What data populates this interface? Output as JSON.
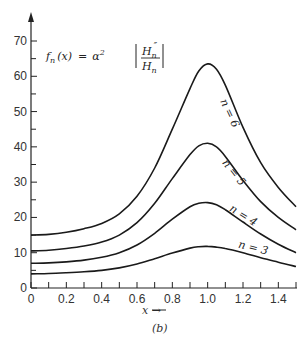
{
  "chart_data": {
    "type": "line",
    "formula": {
      "lhs": "f",
      "lhs_sub": "n",
      "lhs_arg": "(x)",
      "eq": "=",
      "alpha": "α",
      "sup": "2",
      "num": "H",
      "num_sub": "n",
      "num_sup": "″",
      "den": "H",
      "den_sub": "n"
    },
    "xlabel": "x →",
    "ylabel": "",
    "caption": "(b)",
    "xlim": [
      0,
      1.5
    ],
    "ylim": [
      0,
      75
    ],
    "grid": false,
    "legend_position": "inline labels on curves",
    "x_ticks": [
      0,
      0.1,
      0.2,
      0.3,
      0.4,
      0.5,
      0.6,
      0.7,
      0.8,
      0.9,
      1.0,
      1.1,
      1.2,
      1.3,
      1.4,
      1.5
    ],
    "x_tick_labels": [
      "0",
      "0.2",
      "0.4",
      "0.6",
      "0.8",
      "1.0",
      "1.2",
      "1.4"
    ],
    "y_ticks": [
      0,
      5,
      10,
      15,
      20,
      25,
      30,
      35,
      40,
      45,
      50,
      55,
      60,
      65,
      70
    ],
    "y_tick_labels": [
      "0",
      "10",
      "20",
      "30",
      "40",
      "50",
      "60",
      "70"
    ],
    "x": [
      0,
      0.1,
      0.2,
      0.3,
      0.4,
      0.5,
      0.6,
      0.7,
      0.8,
      0.9,
      0.95,
      1.0,
      1.05,
      1.1,
      1.2,
      1.3,
      1.4,
      1.5
    ],
    "series": [
      {
        "name": "n = 3",
        "values": [
          4.0,
          4.1,
          4.3,
          4.6,
          5.0,
          5.7,
          6.8,
          8.3,
          9.9,
          11.3,
          11.7,
          11.8,
          11.6,
          11.2,
          10.0,
          8.6,
          7.3,
          6.1
        ]
      },
      {
        "name": "n = 4",
        "values": [
          7.0,
          7.1,
          7.4,
          7.9,
          8.7,
          10.0,
          12.2,
          15.5,
          19.5,
          23.0,
          24.0,
          24.2,
          23.6,
          22.2,
          18.7,
          15.3,
          12.4,
          10.0
        ]
      },
      {
        "name": "n = 5",
        "values": [
          10.5,
          10.7,
          11.2,
          11.9,
          13.0,
          15.0,
          18.5,
          24.0,
          31.0,
          37.8,
          40.3,
          41.0,
          40.0,
          37.3,
          30.5,
          24.5,
          20.0,
          16.5
        ]
      },
      {
        "name": "n = 6",
        "values": [
          15.0,
          15.2,
          15.8,
          16.8,
          18.3,
          21.0,
          26.0,
          34.0,
          45.0,
          56.5,
          61.5,
          63.5,
          62.0,
          57.5,
          45.5,
          35.5,
          28.5,
          23.0
        ]
      }
    ],
    "label_positions": [
      {
        "name": "n = 3",
        "x": 1.17,
        "y": 11.5,
        "rotate": 14
      },
      {
        "name": "n = 4",
        "x": 1.12,
        "y": 22.0,
        "rotate": 32
      },
      {
        "name": "n = 5",
        "x": 1.08,
        "y": 35.5,
        "rotate": 52
      },
      {
        "name": "n = 6",
        "x": 1.07,
        "y": 53.0,
        "rotate": 65
      }
    ]
  }
}
